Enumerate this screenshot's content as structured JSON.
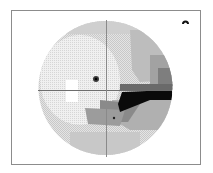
{
  "figure": {
    "type": "visual-field-grayscale-map",
    "eye_marker_icon": "eye-icon",
    "colors": {
      "frame": "#8c8c8c",
      "crosshair": "#6e6e6e",
      "field_light": "#dcdcdc",
      "field_lighter": "#ececec",
      "field_mid": "#b4b4b4",
      "field_dark": "#7a7a7a",
      "scotoma": "#0a0a0a",
      "blind_spot": "#ffffff"
    }
  }
}
